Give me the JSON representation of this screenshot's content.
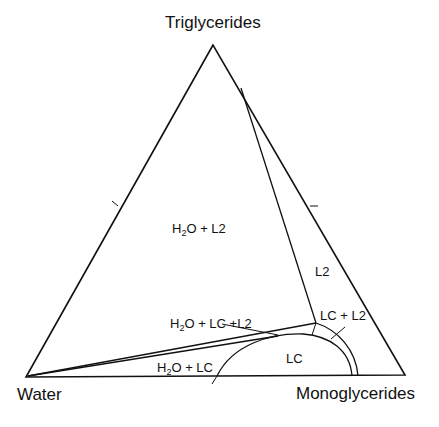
{
  "diagram": {
    "type": "ternary-phase-diagram",
    "vertices": {
      "top": "Triglycerides",
      "left": "Water",
      "right": "Monoglycerides"
    },
    "regions": {
      "h2o_l2": {
        "pre": "H",
        "sub": "2",
        "post": "O + L2"
      },
      "l2": {
        "text": "L2"
      },
      "h2o_lc_l2": {
        "pre": "H",
        "sub": "2",
        "post": "O + LC +L2"
      },
      "lc_l2": {
        "text": "LC + L2"
      },
      "lc": {
        "text": "LC"
      },
      "h2o_lc": {
        "pre": "H",
        "sub": "2",
        "post": "O + LC"
      }
    },
    "line_color": "#111111",
    "background": "#ffffff"
  }
}
